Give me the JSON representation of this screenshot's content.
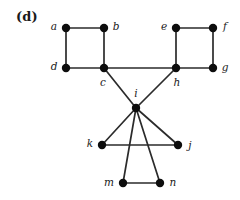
{
  "figure": {
    "panel_label": "(d)",
    "background_color": "#ffffff",
    "edge_color": "#2b2b2b",
    "node_color": "#0d0d0d",
    "label_color": "#1a1a1a",
    "width": 240,
    "height": 200
  },
  "graph": {
    "type": "undirected-graph",
    "node_count": 14,
    "edge_count": 17,
    "nodes": [
      {
        "id": "a",
        "label": "a",
        "x": 66,
        "y": 28,
        "label_x": 54,
        "label_y": 27,
        "label_anchor": "middle"
      },
      {
        "id": "b",
        "label": "b",
        "x": 104,
        "y": 28,
        "label_x": 116,
        "label_y": 27,
        "label_anchor": "middle"
      },
      {
        "id": "c",
        "label": "c",
        "x": 104,
        "y": 68,
        "label_x": 103,
        "label_y": 83,
        "label_anchor": "middle"
      },
      {
        "id": "d",
        "label": "d",
        "x": 66,
        "y": 68,
        "label_x": 54,
        "label_y": 67,
        "label_anchor": "middle"
      },
      {
        "id": "e",
        "label": "e",
        "x": 176,
        "y": 28,
        "label_x": 164,
        "label_y": 27,
        "label_anchor": "middle"
      },
      {
        "id": "f",
        "label": "f",
        "x": 213,
        "y": 28,
        "label_x": 225,
        "label_y": 27,
        "label_anchor": "middle"
      },
      {
        "id": "g",
        "label": "g",
        "x": 213,
        "y": 68,
        "label_x": 225,
        "label_y": 68,
        "label_anchor": "middle"
      },
      {
        "id": "h",
        "label": "h",
        "x": 176,
        "y": 68,
        "label_x": 177,
        "label_y": 83,
        "label_anchor": "middle"
      },
      {
        "id": "i",
        "label": "i",
        "x": 136,
        "y": 108,
        "label_x": 136,
        "label_y": 94,
        "label_anchor": "middle"
      },
      {
        "id": "j",
        "label": "j",
        "x": 178,
        "y": 145,
        "label_x": 190,
        "label_y": 146,
        "label_anchor": "middle"
      },
      {
        "id": "k",
        "label": "k",
        "x": 102,
        "y": 145,
        "label_x": 90,
        "label_y": 144,
        "label_anchor": "middle"
      },
      {
        "id": "m",
        "label": "m",
        "x": 123,
        "y": 183,
        "label_x": 109,
        "label_y": 183,
        "label_anchor": "middle"
      },
      {
        "id": "n",
        "label": "n",
        "x": 160,
        "y": 183,
        "label_x": 173,
        "label_y": 183,
        "label_anchor": "middle"
      }
    ],
    "edges": [
      {
        "from": "a",
        "to": "b",
        "name": "edge-a-b"
      },
      {
        "from": "a",
        "to": "d",
        "name": "edge-a-d"
      },
      {
        "from": "b",
        "to": "c",
        "name": "edge-b-c"
      },
      {
        "from": "d",
        "to": "c",
        "name": "edge-d-c"
      },
      {
        "from": "e",
        "to": "f",
        "name": "edge-e-f"
      },
      {
        "from": "e",
        "to": "h",
        "name": "edge-e-h"
      },
      {
        "from": "f",
        "to": "g",
        "name": "edge-f-g"
      },
      {
        "from": "h",
        "to": "g",
        "name": "edge-h-g"
      },
      {
        "from": "c",
        "to": "h",
        "name": "edge-c-h"
      },
      {
        "from": "c",
        "to": "i",
        "name": "edge-c-i"
      },
      {
        "from": "h",
        "to": "i",
        "name": "edge-h-i"
      },
      {
        "from": "i",
        "to": "k",
        "name": "edge-i-k"
      },
      {
        "from": "i",
        "to": "j",
        "name": "edge-i-j"
      },
      {
        "from": "i",
        "to": "m",
        "name": "edge-i-m"
      },
      {
        "from": "i",
        "to": "n",
        "name": "edge-i-n"
      },
      {
        "from": "k",
        "to": "j",
        "name": "edge-k-j"
      },
      {
        "from": "m",
        "to": "n",
        "name": "edge-m-n"
      }
    ]
  }
}
